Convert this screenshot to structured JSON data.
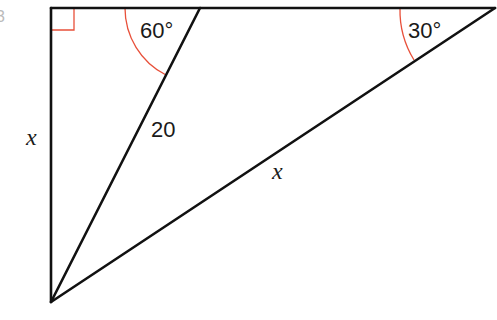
{
  "figure": {
    "type": "geometry-diagram",
    "vertices": {
      "top_left": [
        51,
        8
      ],
      "top_mid": [
        200,
        8
      ],
      "top_right": [
        495,
        8
      ],
      "bottom": [
        51,
        302
      ]
    },
    "colors": {
      "lines": "#111111",
      "angle_markers": "#e8503a",
      "text": "#1a1a1a"
    }
  },
  "labels": {
    "left_side": "x",
    "cevian": "20",
    "hypotenuse": "x",
    "angle_mid": "60°",
    "angle_right": "30°"
  },
  "angles": {
    "right_angle_at": "top_left",
    "mid_vertex_deg": 60,
    "right_vertex_deg": 30
  }
}
